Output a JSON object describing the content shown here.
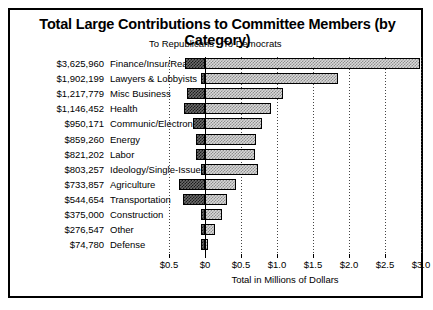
{
  "chart": {
    "title": "Total Large Contributions to Committee Members (by Category)",
    "legend": {
      "republicans": "To Republicans",
      "democrats": "To Democrats"
    },
    "xaxis_title": "Total in Millions of Dollars"
  },
  "chart_data": {
    "type": "bar",
    "orientation": "horizontal",
    "subtype": "diverging-stacked",
    "title": "Total Large Contributions to Committee Members (by Category)",
    "xlabel": "Total in Millions of Dollars",
    "ylabel": "",
    "xlim": [
      -0.75,
      3.0
    ],
    "grid": true,
    "legend_position": "top",
    "tick_labels": [
      "$0.5",
      "$0",
      "$0.5",
      "$1.0",
      "$1.5",
      "$2.0",
      "$2.5",
      "$3.0"
    ],
    "tick_values": [
      -0.5,
      0.0,
      0.5,
      1.0,
      1.5,
      2.0,
      2.5,
      3.0
    ],
    "series": [
      {
        "name": "To Republicans",
        "values": [
          -0.28,
          -0.06,
          -0.25,
          -0.29,
          -0.17,
          -0.13,
          -0.12,
          -0.05,
          -0.36,
          -0.31,
          -0.05,
          -0.06,
          -0.06
        ]
      },
      {
        "name": "To Democrats",
        "values": [
          2.99,
          1.85,
          1.09,
          0.92,
          0.79,
          0.71,
          0.7,
          0.74,
          0.43,
          0.3,
          0.23,
          0.14,
          0.03
        ]
      }
    ],
    "categories": [
      "Finance/Insur/Real Est",
      "Lawyers & Lobbyists",
      "Misc Business",
      "Health",
      "Communic/Electronics",
      "Energy",
      "Labor",
      "Ideology/Single-Issue",
      "Agriculture",
      "Transportation",
      "Construction",
      "Other",
      "Defense"
    ],
    "totals_labels": [
      "$3,625,960",
      "$1,902,199",
      "$1,217,779",
      "$1,146,452",
      "$950,171",
      "$859,260",
      "$821,202",
      "$803,257",
      "$733,857",
      "$544,654",
      "$375,000",
      "$276,547",
      "$74,780"
    ],
    "totals_values": [
      3625960,
      1902199,
      1217779,
      1146452,
      950171,
      859260,
      821202,
      803257,
      733857,
      544654,
      375000,
      276547,
      74780
    ]
  }
}
